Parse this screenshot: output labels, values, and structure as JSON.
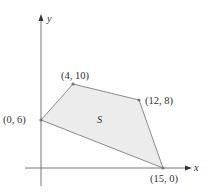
{
  "diagram": {
    "axes": {
      "x_label": "x",
      "y_label": "y"
    },
    "region": {
      "label": "S",
      "fill": "#ececec",
      "stroke": "#8a8a8a"
    },
    "vertices": [
      {
        "label": "(0, 6)",
        "x": 0,
        "y": 6
      },
      {
        "label": "(4, 10)",
        "x": 4,
        "y": 10
      },
      {
        "label": "(12, 8)",
        "x": 12,
        "y": 8
      },
      {
        "label": "(15, 0)",
        "x": 15,
        "y": 0
      }
    ]
  }
}
